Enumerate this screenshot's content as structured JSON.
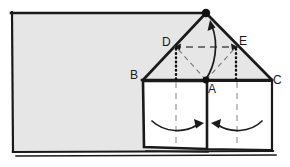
{
  "figure": {
    "background_color": "#ffffff",
    "fill_color": "#e6e6e6",
    "stroke_color": "#111111",
    "panel_fill": "#ffffff",
    "labels": {
      "apex_vertex": "",
      "a": "A",
      "b": "B",
      "c": "C",
      "d": "D",
      "e": "E"
    },
    "label_positions": {
      "a": {
        "x": 208,
        "y": 93
      },
      "b": {
        "x": 130,
        "y": 79
      },
      "c": {
        "x": 273,
        "y": 84
      },
      "d": {
        "x": 162,
        "y": 46
      },
      "e": {
        "x": 239,
        "y": 45
      }
    },
    "points": {
      "apex": {
        "x": 206,
        "y": 13
      },
      "a": {
        "x": 206,
        "y": 80
      },
      "b": {
        "x": 143,
        "y": 80
      },
      "c": {
        "x": 272,
        "y": 80
      },
      "d": {
        "x": 176,
        "y": 47
      },
      "e": {
        "x": 236,
        "y": 47
      },
      "sheet_tl": {
        "x": 11,
        "y": 12
      },
      "sheet_tr": {
        "x": 206,
        "y": 13
      },
      "sheet_bl": {
        "x": 13,
        "y": 152
      },
      "sheet_br": {
        "x": 272,
        "y": 150
      }
    },
    "elements": [
      {
        "name": "background-sheet",
        "kind": "polygon-filled"
      },
      {
        "name": "roof-triangle",
        "kind": "polygon-filled"
      },
      {
        "name": "left-panel",
        "kind": "rect-white"
      },
      {
        "name": "right-panel",
        "kind": "rect-white"
      },
      {
        "name": "dashed-line-d-to-e",
        "kind": "dashed"
      },
      {
        "name": "dashed-line-a-to-d",
        "kind": "dashed"
      },
      {
        "name": "dashed-line-a-to-e",
        "kind": "dashed"
      },
      {
        "name": "dotted-line-d-down",
        "kind": "dotted"
      },
      {
        "name": "dotted-line-e-down",
        "kind": "dotted"
      },
      {
        "name": "dashed-centerline-left",
        "kind": "dashed"
      },
      {
        "name": "dashed-centerline-right",
        "kind": "dashed"
      },
      {
        "name": "curved-arrow-a-to-apex",
        "kind": "arrow"
      },
      {
        "name": "curved-arrow-left-panel",
        "kind": "arrow"
      },
      {
        "name": "curved-arrow-right-panel",
        "kind": "arrow"
      },
      {
        "name": "arrowhead-toward-d",
        "kind": "arrowhead"
      },
      {
        "name": "arrowhead-toward-e",
        "kind": "arrowhead"
      }
    ]
  }
}
